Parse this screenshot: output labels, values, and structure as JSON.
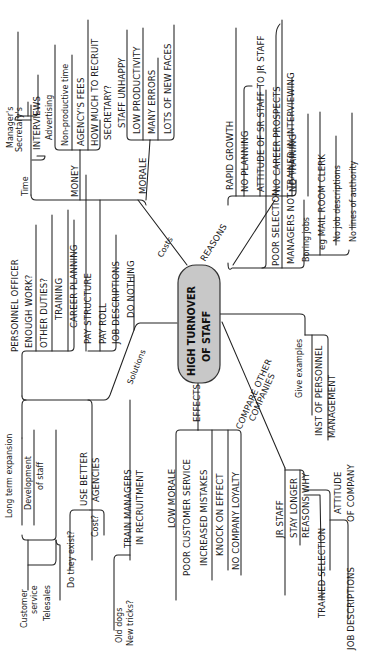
{
  "diagram": {
    "type": "mind-map",
    "orientation": "rotated-90-ccw",
    "colors": {
      "background": "#ffffff",
      "ink": "#1a1a1a",
      "center_fill": "#c8c8c8",
      "center_stroke": "#333333"
    },
    "center": {
      "line1": "HIGH TURNOVER",
      "line2": "OF STAFF"
    },
    "branches": {
      "costs": {
        "label": "Costs",
        "time": {
          "label": "Time",
          "managers": "Manager's",
          "secretarys": "Secretary's",
          "interviews": "INTERVIEWS"
        },
        "money": {
          "label": "MONEY",
          "advertising": "Advertising",
          "non_productive_time": "Non-productive time",
          "agency_fees": "AGENCY'S FEES",
          "how_much_1": "HOW MUCH TO RECRUIT",
          "how_much_2": "SECRETARY?"
        },
        "morale": {
          "label": "MORALE",
          "staff_unhappy": "STAFF UNHAPPY",
          "low_productivity": "LOW PRODUCTIVITY",
          "many_errors": "MANY ERRORS",
          "new_faces": "LOTS OF NEW FACES"
        }
      },
      "reasons": {
        "label": "REASONS",
        "rapid_growth": {
          "label": "RAPID GROWTH",
          "no_planning": "NO PLANNING",
          "attitude": "ATTITUDE OF SR STAFF TO JR STAFF",
          "no_career": "NO CAREER PROSPECTS",
          "no_training": "NO TRAINING"
        },
        "poor_selection": {
          "label": "POOR SELECTION",
          "managers_not_trained": "MANAGERS NOT TRAINED IN INTERVIEWING"
        },
        "boring_jobs": {
          "label": "Boring jobs",
          "mail_room": "eg MAIL ROOM CLERK",
          "no_job_desc": "No job descriptions",
          "no_authority": "No lines of authority"
        }
      },
      "solutions": {
        "label": "Solutions",
        "personnel_officer": {
          "label": "PERSONNEL OFFICER",
          "enough_work": "ENOUGH WORK?",
          "other_duties": "OTHER DUTIES?",
          "training": "TRAINING",
          "career_planning": "CAREER PLANNING",
          "pay_structure": "PAY STRUCTURE",
          "pay_roll": "PAY ROLL",
          "job_descriptions": "JOB DESCRIPTIONS"
        },
        "do_nothing": "DO NOTHING",
        "long_term": {
          "label": "Long term expansion",
          "development_1": "Development",
          "development_2": "of staff",
          "customer_1": "Customer",
          "customer_2": "service",
          "telesales": "Telesales"
        },
        "agencies": {
          "label_1": "USE BETTER",
          "label_2": "AGENCIES",
          "exist": "Do they exist?",
          "cost": "Cost?"
        },
        "train_managers": {
          "label_1": "TRAIN MANAGERS",
          "label_2": "IN RECRUITMENT",
          "old_dogs": "Old dogs",
          "new_tricks": "New tricks?"
        }
      },
      "effects": {
        "label": "EFFECTS",
        "low_morale": "LOW MORALE",
        "poor_service": "POOR CUSTOMER SERVICE",
        "increased_mistakes": "INCREASED MISTAKES",
        "knock_on": "KNOCK ON EFFECT",
        "no_loyalty": "NO COMPANY LOYALTY"
      },
      "compare": {
        "label_1": "COMPARE OTHER",
        "label_2": "COMPANIES",
        "give_examples": "Give examples",
        "inst_1": "INST OF PERSONNEL",
        "inst_2": "MANAGEMENT",
        "jr_staff": "JR STAFF",
        "stay_longer": "STAY LONGER",
        "reasons_why": "REASONS WHY",
        "attitude_1": "ATTITUDE",
        "attitude_2": "OF COMPANY",
        "trained_selection": "TRAINED SELECTION",
        "job_descriptions": "JOB DESCRIPTIONS"
      }
    }
  }
}
